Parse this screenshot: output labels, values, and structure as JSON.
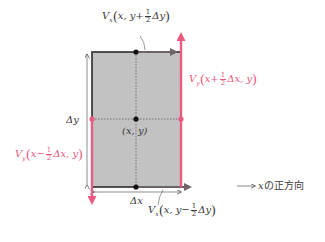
{
  "diagram": {
    "colors": {
      "cell_fill": "#c2c2c2",
      "cell_border": "#2a2a2a",
      "vy_arrow": "#ec5a82",
      "vx_arrow": "#6e6468",
      "dot": "#111111",
      "dotted": "#555555",
      "label_dark": "#3a3a3a",
      "label_pink": "#e8587e"
    },
    "cell": {
      "center_label": "(x, y)",
      "width_label": "Δx",
      "height_label": "Δy"
    },
    "labels": {
      "top": {
        "symbol": "V",
        "sub": "x",
        "pre": "x, y+",
        "num": "1",
        "den": "2",
        "post": "Δy",
        "color": "dark"
      },
      "bottom": {
        "symbol": "V",
        "sub": "x",
        "pre": "x, y−",
        "num": "1",
        "den": "2",
        "post": "Δy",
        "color": "dark"
      },
      "right": {
        "symbol": "V",
        "sub": "y",
        "pre": "x+",
        "num": "1",
        "den": "2",
        "post": "Δx, y",
        "color": "pink"
      },
      "left": {
        "symbol": "V",
        "sub": "y",
        "pre": "x−",
        "num": "1",
        "den": "2",
        "post": "Δx, y",
        "color": "pink"
      }
    },
    "legend": {
      "arrow": "⟶",
      "text_var": "x",
      "text_jp": "の正方向"
    }
  }
}
